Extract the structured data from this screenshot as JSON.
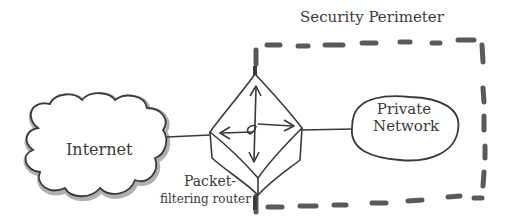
{
  "diagram": {
    "title": "Security Perimeter",
    "nodes": [
      {
        "id": "internet",
        "label": "Internet",
        "shape": "cloud"
      },
      {
        "id": "router",
        "label_line1": "Packet-",
        "label_line2": "filtering router",
        "shape": "hand-drawn-diamond-with-arrows"
      },
      {
        "id": "private",
        "label_line1": "Private",
        "label_line2": "Network",
        "shape": "oval"
      }
    ],
    "edges": [
      {
        "from": "internet",
        "to": "router"
      },
      {
        "from": "router",
        "to": "private"
      }
    ],
    "perimeter": {
      "style": "dashed",
      "encloses": [
        "router",
        "private"
      ]
    },
    "colors": {
      "stroke": "#3a3a3a",
      "dash": "#5a5a5a",
      "cloud_shadow": "#9a9a9a",
      "background": "#ffffff"
    }
  }
}
